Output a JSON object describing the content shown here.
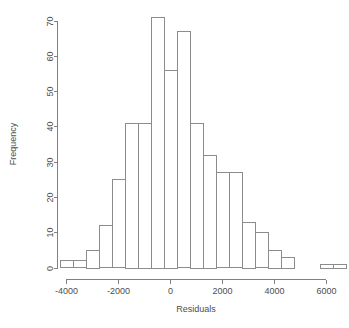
{
  "chart_data": {
    "type": "bar",
    "chart_kind": "histogram",
    "title": "",
    "xlabel": "Residuals",
    "ylabel": "Frequency",
    "xlim": [
      -4250,
      6250
    ],
    "ylim": [
      0,
      71
    ],
    "xticks": [
      -4000,
      -2000,
      0,
      2000,
      4000,
      6000
    ],
    "xtick_labels": [
      "-4000",
      "-2000",
      "0",
      "2000",
      "4000",
      "6000"
    ],
    "yticks": [
      0,
      10,
      20,
      30,
      40,
      50,
      60,
      70
    ],
    "ytick_labels": [
      "0",
      "10",
      "20",
      "30",
      "40",
      "50",
      "60",
      "70"
    ],
    "grid": false,
    "legend": "none",
    "bin_width": 500,
    "bar_fill": "#ffffff",
    "bar_stroke": "#8c8c8c",
    "axis_color": "#808080",
    "text_color": "#4d4d4d",
    "bins": [
      {
        "start": -4250,
        "end": -3750,
        "center": -4000,
        "count": 2
      },
      {
        "start": -3750,
        "end": -3250,
        "center": -3500,
        "count": 2
      },
      {
        "start": -3250,
        "end": -2750,
        "center": -3000,
        "count": 5
      },
      {
        "start": -2750,
        "end": -2250,
        "center": -2500,
        "count": 12
      },
      {
        "start": -2250,
        "end": -1750,
        "center": -2000,
        "count": 25
      },
      {
        "start": -1750,
        "end": -1250,
        "center": -1500,
        "count": 41
      },
      {
        "start": -1250,
        "end": -750,
        "center": -1000,
        "count": 41
      },
      {
        "start": -750,
        "end": -250,
        "center": -500,
        "count": 71
      },
      {
        "start": -250,
        "end": 250,
        "center": 0,
        "count": 56
      },
      {
        "start": 250,
        "end": 750,
        "center": 500,
        "count": 67
      },
      {
        "start": 750,
        "end": 1250,
        "center": 1000,
        "count": 41
      },
      {
        "start": 1250,
        "end": 1750,
        "center": 1500,
        "count": 32
      },
      {
        "start": 1750,
        "end": 2250,
        "center": 2000,
        "count": 27
      },
      {
        "start": 2250,
        "end": 2750,
        "center": 2500,
        "count": 27
      },
      {
        "start": 2750,
        "end": 3250,
        "center": 3000,
        "count": 13
      },
      {
        "start": 3250,
        "end": 3750,
        "center": 3500,
        "count": 10
      },
      {
        "start": 3750,
        "end": 4250,
        "center": 4000,
        "count": 5
      },
      {
        "start": 4250,
        "end": 4750,
        "center": 4500,
        "count": 3
      },
      {
        "start": 4750,
        "end": 5250,
        "center": 5000,
        "count": 0
      },
      {
        "start": 5250,
        "end": 5750,
        "center": 5500,
        "count": 0
      },
      {
        "start": 5750,
        "end": 6250,
        "center": 6000,
        "count": 1
      },
      {
        "start": 6250,
        "end": 6750,
        "center": 6500,
        "count": 1
      }
    ]
  }
}
